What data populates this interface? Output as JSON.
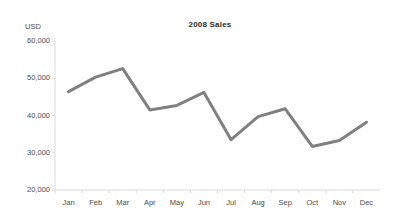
{
  "chart_data": {
    "type": "line",
    "title": "2008 Sales",
    "xlabel": "",
    "ylabel": "USD",
    "categories": [
      "Jan",
      "Feb",
      "Mar",
      "Apr",
      "May",
      "Jun",
      "Jul",
      "Aug",
      "Sep",
      "Oct",
      "Nov",
      "Dec"
    ],
    "values": [
      46400,
      50300,
      52600,
      41500,
      42700,
      46200,
      33500,
      39700,
      41800,
      31700,
      33300,
      38200
    ],
    "series": [
      {
        "name": "2008 Sales",
        "values": [
          46400,
          50300,
          52600,
          41500,
          42700,
          46200,
          33500,
          39700,
          41800,
          31700,
          33300,
          38200
        ]
      }
    ],
    "ylim": [
      20000,
      60000
    ],
    "y_ticks": [
      60000,
      50000,
      40000,
      30000,
      20000
    ],
    "y_tick_labels": [
      "60,000",
      "50,000",
      "40,000",
      "30,000",
      "20,000"
    ],
    "grid": false,
    "legend": false,
    "legend_position": "none",
    "line_color": "#808080",
    "line_width": 3,
    "markers": false,
    "background_color": "#ffffff",
    "axis_color": "#d9d9d9",
    "text_color": "#4a4a4a"
  }
}
